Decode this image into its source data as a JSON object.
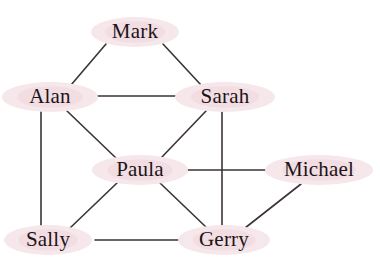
{
  "figure": {
    "title": "",
    "background_color": "#ffffff",
    "node_halo_color": "#f6e7ea",
    "node_halo_inner_color": "#f2dde2",
    "edge_color": "#3b3338",
    "label_color": "#1a1418"
  },
  "graph": {
    "type": "undirected-node-link",
    "node_count": 8,
    "edge_count": 12,
    "nodes": [
      {
        "id": "mark",
        "label": "Mark",
        "x": 135,
        "y": 32,
        "rx": 44,
        "ry": 15,
        "degree": 2
      },
      {
        "id": "alan",
        "label": "Alan",
        "x": 50,
        "y": 97,
        "rx": 48,
        "ry": 15,
        "degree": 4
      },
      {
        "id": "sarah",
        "label": "Sarah",
        "x": 225,
        "y": 97,
        "rx": 50,
        "ry": 15,
        "degree": 4
      },
      {
        "id": "paula",
        "label": "Paula",
        "x": 140,
        "y": 170,
        "rx": 48,
        "ry": 15,
        "degree": 5
      },
      {
        "id": "michael",
        "label": "Michael",
        "x": 319,
        "y": 170,
        "rx": 54,
        "ry": 15,
        "degree": 2
      },
      {
        "id": "sally",
        "label": "Sally",
        "x": 48,
        "y": 240,
        "rx": 44,
        "ry": 15,
        "degree": 3
      },
      {
        "id": "gerry",
        "label": "Gerry",
        "x": 224,
        "y": 240,
        "rx": 46,
        "ry": 15,
        "degree": 4
      }
    ],
    "edges": [
      {
        "id": "mark-alan",
        "source": "mark",
        "target": "alan",
        "x1": 106,
        "y1": 44,
        "x2": 71,
        "y2": 85
      },
      {
        "id": "mark-sarah",
        "source": "mark",
        "target": "sarah",
        "x1": 163,
        "y1": 44,
        "x2": 201,
        "y2": 85
      },
      {
        "id": "alan-sarah",
        "source": "alan",
        "target": "sarah",
        "x1": 88,
        "y1": 96,
        "x2": 188,
        "y2": 96
      },
      {
        "id": "alan-paula",
        "source": "alan",
        "target": "paula",
        "x1": 67,
        "y1": 111,
        "x2": 116,
        "y2": 158
      },
      {
        "id": "alan-sally",
        "source": "alan",
        "target": "sally",
        "x1": 41,
        "y1": 112,
        "x2": 41,
        "y2": 226
      },
      {
        "id": "sarah-paula",
        "source": "sarah",
        "target": "paula",
        "x1": 206,
        "y1": 111,
        "x2": 161,
        "y2": 158
      },
      {
        "id": "sarah-gerry",
        "source": "sarah",
        "target": "gerry",
        "x1": 222,
        "y1": 112,
        "x2": 222,
        "y2": 226
      },
      {
        "id": "paula-michael",
        "source": "paula",
        "target": "michael",
        "x1": 178,
        "y1": 170,
        "x2": 280,
        "y2": 170
      },
      {
        "id": "paula-sally",
        "source": "paula",
        "target": "sally",
        "x1": 117,
        "y1": 183,
        "x2": 70,
        "y2": 228
      },
      {
        "id": "paula-gerry",
        "source": "paula",
        "target": "gerry",
        "x1": 160,
        "y1": 183,
        "x2": 207,
        "y2": 228
      },
      {
        "id": "michael-gerry",
        "source": "michael",
        "target": "gerry",
        "x1": 301,
        "y1": 184,
        "x2": 245,
        "y2": 228
      },
      {
        "id": "sally-gerry",
        "source": "sally",
        "target": "gerry",
        "x1": 95,
        "y1": 240,
        "x2": 182,
        "y2": 240
      }
    ]
  }
}
